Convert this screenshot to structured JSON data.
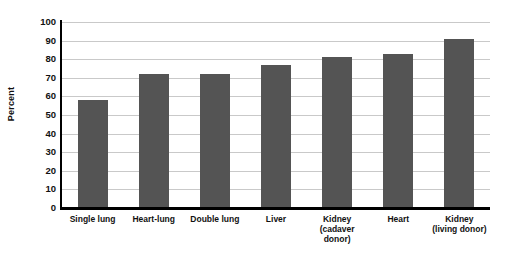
{
  "chart_data": {
    "type": "bar",
    "title": "",
    "subtitle": "",
    "xlabel": "",
    "ylabel": "Percent",
    "ylim": [
      0,
      100
    ],
    "ytick_step": 10,
    "yticks": [
      100,
      90,
      80,
      70,
      60,
      50,
      40,
      30,
      20,
      10,
      0
    ],
    "grid": true,
    "legend": false,
    "legend_position": "none",
    "bar_color": "#545454",
    "gridline_color": "#c9c9c9",
    "axis_color": "#000000",
    "background_color": "#ffffff",
    "categories": [
      "Single lung",
      "Heart-lung",
      "Double lung",
      "Liver",
      "Kidney (cadaver donor)",
      "Kidney (living donor)",
      "Heart"
    ],
    "category_lines": [
      [
        "Single lung",
        ""
      ],
      [
        "Heart-lung",
        ""
      ],
      [
        "Double lung",
        ""
      ],
      [
        "Liver",
        ""
      ],
      [
        "Kidney",
        "(cadaver donor)"
      ],
      [
        "Heart",
        ""
      ],
      [
        "Kidney",
        "(living donor)"
      ]
    ],
    "values": [
      58,
      72,
      72,
      77,
      81,
      83,
      91
    ],
    "bars": [
      {
        "label": "Single lung",
        "line1": "Single lung",
        "line2": "",
        "value": 58
      },
      {
        "label": "Heart-lung",
        "line1": "Heart-lung",
        "line2": "",
        "value": 72
      },
      {
        "label": "Double lung",
        "line1": "Double lung",
        "line2": "",
        "value": 72
      },
      {
        "label": "Liver",
        "line1": "Liver",
        "line2": "",
        "value": 77
      },
      {
        "label": "Kidney (cadaver donor)",
        "line1": "Kidney",
        "line2": "(cadaver donor)",
        "value": 81
      },
      {
        "label": "Heart",
        "line1": "Heart",
        "line2": "",
        "value": 83
      },
      {
        "label": "Kidney (living donor)",
        "line1": "Kidney",
        "line2": "(living donor)",
        "value": 91
      }
    ]
  }
}
